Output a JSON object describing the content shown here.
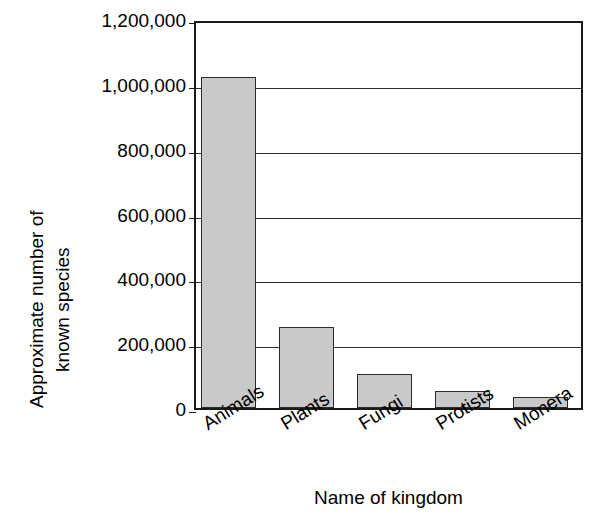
{
  "chart_data": {
    "type": "bar",
    "title": "",
    "subtitle": "",
    "xlabel": "Name of kingdom",
    "ylabel_lines": [
      "Approximate number of",
      "known species"
    ],
    "ylabel": "Approximate number of known species",
    "categories": [
      "Animals",
      "Plants",
      "Fungi",
      "Protists",
      "Monera"
    ],
    "values": [
      1021000,
      251000,
      106000,
      52000,
      33000
    ],
    "ylim": [
      0,
      1200000
    ],
    "ytick_values": [
      1200000,
      1000000,
      800000,
      600000,
      400000,
      200000,
      0
    ],
    "ytick_labels": [
      "1,200,000",
      "1,000,000",
      "800,000",
      "600,000",
      "400,000",
      "200,000",
      "0"
    ],
    "grid": "horizontal",
    "legend": "none",
    "bar_fill_color": "#c9c9c9",
    "bar_edge_color": "#2b2b2b",
    "axis_color": "#1a1a1a",
    "background_color": "#ffffff",
    "xtick_rotation": -32
  }
}
